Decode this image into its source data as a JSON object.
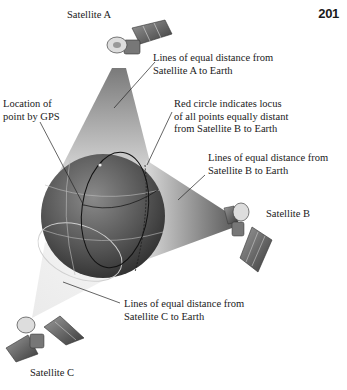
{
  "page_number": "201",
  "satellites": {
    "a": {
      "label": "Satellite A"
    },
    "b": {
      "label": "Satellite B"
    },
    "c": {
      "label": "Satellite C"
    }
  },
  "annotations": {
    "lines_a": "Lines of equal distance from\nSatellite A to Earth",
    "gps_location": "Location of\npoint by GPS",
    "red_circle": "Red circle indicates locus\nof all points equally distant\nfrom Satellite B to Earth",
    "lines_b": "Lines of equal distance from\nSatellite B to Earth",
    "lines_c": "Lines of equal distance from\nSatellite C to Earth"
  },
  "colors": {
    "globe_dark": "#3a3a3a",
    "globe_light": "#8a8a8a",
    "cone": "#9a9a9a",
    "text": "#1a1a1a"
  }
}
